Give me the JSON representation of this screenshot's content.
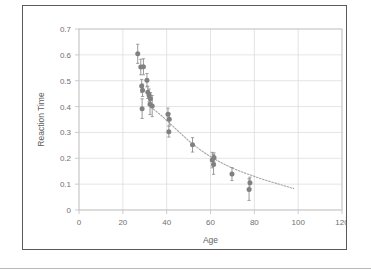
{
  "chart_data": {
    "type": "scatter",
    "title": "",
    "xlabel": "Age",
    "ylabel": "Reaction Time",
    "xlim": [
      0,
      120
    ],
    "ylim": [
      0,
      0.7
    ],
    "xticks": [
      "0",
      "20",
      "40",
      "60",
      "80",
      "100",
      "120"
    ],
    "xtick_values": [
      0,
      20,
      40,
      60,
      80,
      100,
      120
    ],
    "yticks": [
      "0",
      "0.1",
      "0.2",
      "0.3",
      "0.4",
      "0.5",
      "0.6",
      "0.7"
    ],
    "ytick_values": [
      0,
      0.1,
      0.2,
      0.3,
      0.4,
      0.5,
      0.6,
      0.7
    ],
    "grid": true,
    "grid_axis": "both",
    "legend": false,
    "marker_color": "#808080",
    "errorbar_color": "#8c8c8c",
    "trendline_color": "#a6a6a6",
    "trendline_style": "dotted",
    "gridline_color": "#d9d9d9",
    "axis_color": "#bfbfbf",
    "points": [
      {
        "x": 26.8,
        "y": 0.604,
        "yerr": 0.037
      },
      {
        "x": 28.2,
        "y": 0.553,
        "yerr": 0.03
      },
      {
        "x": 29.4,
        "y": 0.554,
        "yerr": 0.031
      },
      {
        "x": 28.6,
        "y": 0.48,
        "yerr": 0.025
      },
      {
        "x": 29.0,
        "y": 0.463,
        "yerr": 0.024
      },
      {
        "x": 28.8,
        "y": 0.392,
        "yerr": 0.038
      },
      {
        "x": 31.0,
        "y": 0.502,
        "yerr": 0.026
      },
      {
        "x": 31.4,
        "y": 0.455,
        "yerr": 0.024
      },
      {
        "x": 32.0,
        "y": 0.443,
        "yerr": 0.025
      },
      {
        "x": 32.6,
        "y": 0.43,
        "yerr": 0.024
      },
      {
        "x": 32.4,
        "y": 0.409,
        "yerr": 0.04
      },
      {
        "x": 33.4,
        "y": 0.402,
        "yerr": 0.041
      },
      {
        "x": 40.6,
        "y": 0.37,
        "yerr": 0.024
      },
      {
        "x": 41.2,
        "y": 0.351,
        "yerr": 0.023
      },
      {
        "x": 41.0,
        "y": 0.303,
        "yerr": 0.021
      },
      {
        "x": 51.8,
        "y": 0.252,
        "yerr": 0.028
      },
      {
        "x": 60.8,
        "y": 0.193,
        "yerr": 0.03
      },
      {
        "x": 61.6,
        "y": 0.203,
        "yerr": 0.018
      },
      {
        "x": 61.4,
        "y": 0.176,
        "yerr": 0.038
      },
      {
        "x": 69.8,
        "y": 0.139,
        "yerr": 0.025
      },
      {
        "x": 78.0,
        "y": 0.105,
        "yerr": 0.022
      },
      {
        "x": 77.6,
        "y": 0.079,
        "yerr": 0.042
      }
    ],
    "trendline": {
      "description": "power-law decay fit",
      "x_start": 34,
      "x_end": 98,
      "points": [
        {
          "x": 34,
          "y": 0.39
        },
        {
          "x": 38,
          "y": 0.362
        },
        {
          "x": 42,
          "y": 0.331
        },
        {
          "x": 46,
          "y": 0.299
        },
        {
          "x": 50,
          "y": 0.268
        },
        {
          "x": 54,
          "y": 0.241
        },
        {
          "x": 58,
          "y": 0.217
        },
        {
          "x": 62,
          "y": 0.196
        },
        {
          "x": 66,
          "y": 0.178
        },
        {
          "x": 70,
          "y": 0.162
        },
        {
          "x": 74,
          "y": 0.148
        },
        {
          "x": 78,
          "y": 0.136
        },
        {
          "x": 82,
          "y": 0.124
        },
        {
          "x": 86,
          "y": 0.113
        },
        {
          "x": 90,
          "y": 0.103
        },
        {
          "x": 94,
          "y": 0.093
        },
        {
          "x": 98,
          "y": 0.083
        }
      ]
    }
  }
}
